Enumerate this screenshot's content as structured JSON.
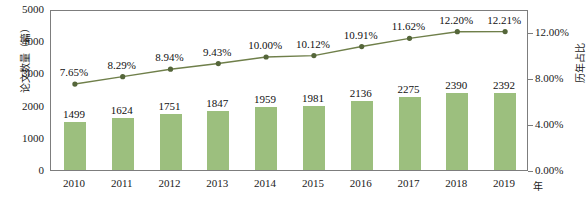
{
  "chart_data": {
    "type": "bar",
    "title": "",
    "subtitle": "",
    "xlabel": "年",
    "ylabel": "论文数量（篇）",
    "y2label": "历年占比",
    "categories": [
      "2010",
      "2011",
      "2012",
      "2013",
      "2014",
      "2015",
      "2016",
      "2017",
      "2018",
      "2019"
    ],
    "xtick_labels": [
      "2010",
      "2011",
      "2012",
      "2013",
      "2014",
      "2015",
      "2016",
      "2017",
      "2018",
      "2019"
    ],
    "ytick_labels": [
      "0",
      "1000",
      "2000",
      "3000",
      "4000",
      "5000"
    ],
    "ytick_values": [
      0,
      1000,
      2000,
      3000,
      4000,
      5000
    ],
    "ylim": [
      0,
      5000
    ],
    "y2tick_labels": [
      "0.00%",
      "4.00%",
      "8.00%",
      "12.00%"
    ],
    "y2tick_values": [
      0,
      4,
      8,
      12
    ],
    "y2lim": [
      0,
      14
    ],
    "grid": false,
    "legend": "none",
    "series": [
      {
        "name": "论文数量（篇）",
        "type": "bar",
        "axis": "left",
        "color": "#9cbf7e",
        "values": [
          1499,
          1624,
          1751,
          1847,
          1959,
          1981,
          2136,
          2275,
          2390,
          2392
        ],
        "data_labels": [
          "1499",
          "1624",
          "1751",
          "1847",
          "1959",
          "1981",
          "2136",
          "2275",
          "2390",
          "2392"
        ]
      },
      {
        "name": "历年占比",
        "type": "line",
        "axis": "right",
        "color": "#6f7f4a",
        "marker_color": "#55663a",
        "values": [
          7.65,
          8.29,
          8.94,
          9.43,
          10.0,
          10.12,
          10.91,
          11.62,
          12.2,
          12.21
        ],
        "data_labels": [
          "7.65%",
          "8.29%",
          "8.94%",
          "9.43%",
          "10.00%",
          "10.12%",
          "10.91%",
          "11.62%",
          "12.20%",
          "12.21%"
        ]
      }
    ],
    "colors": {
      "bar": "#9cbf7e",
      "line": "#6f7f4a",
      "marker": "#55663a",
      "frame": "#7d7d7d",
      "text": "#1a1a1a",
      "background": "#ffffff"
    }
  }
}
